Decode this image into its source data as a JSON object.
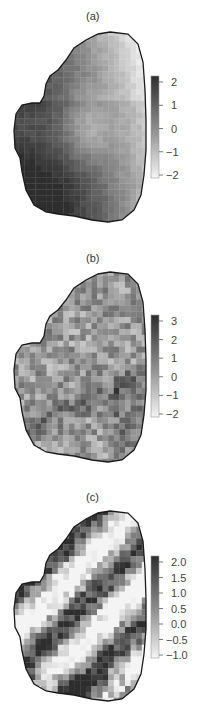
{
  "chart_data": [
    {
      "type": "heatmap",
      "title": "(a)",
      "colorbar": {
        "ticks": [
          "2",
          "1",
          "0",
          "−1",
          "−2"
        ],
        "min": -2.3,
        "max": 2.3
      },
      "description": "Smooth spatial field: dark (high) along left lobe and bottom, light (low) along right edge",
      "grid": {
        "cols": 24,
        "rows": 33,
        "pattern": "smooth",
        "seed": 11
      }
    },
    {
      "type": "heatmap",
      "title": "(b)",
      "colorbar": {
        "ticks": [
          "3",
          "2",
          "1",
          "0",
          "−1",
          "−2"
        ],
        "min": -2.1,
        "max": 3.6
      },
      "description": "Noisy spatial field with mid-gray values, darker band lower-left to right",
      "grid": {
        "cols": 24,
        "rows": 33,
        "pattern": "noisy",
        "seed": 23
      }
    },
    {
      "type": "heatmap",
      "title": "(c)",
      "colorbar": {
        "ticks": [
          "2.0",
          "1.5",
          "1.0",
          "0.5",
          "0.0",
          "−0.5",
          "−1.0"
        ],
        "min": -1.1,
        "max": 2.2
      },
      "description": "High-contrast diagonal stripes of dark and white cells",
      "grid": {
        "cols": 24,
        "rows": 33,
        "pattern": "stripes",
        "seed": 37
      }
    }
  ],
  "colors": {
    "high": "#2e2e2e",
    "low": "#f4f4f4",
    "outline": "#1a1a1a",
    "axis": "#555555"
  }
}
